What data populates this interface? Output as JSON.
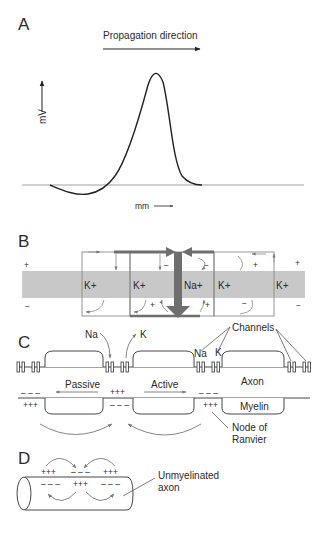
{
  "figure": {
    "panels": {
      "A": {
        "label": "A",
        "propagation_label": "Propagation direction",
        "y_axis_label": "mV",
        "x_axis_label": "mm",
        "curve": "action-potential"
      },
      "B": {
        "label": "B",
        "ion_labels": [
          "K+",
          "K+",
          "Na+",
          "K+",
          "K+"
        ],
        "outside_charges": [
          "+",
          "−",
          "−",
          "+",
          "+"
        ],
        "inside_charges": [
          "−",
          "+",
          "+",
          "−",
          "−"
        ]
      },
      "C": {
        "label": "C",
        "na_label": "Na",
        "k_label": "K",
        "channels_label": "Channels",
        "na_label_2": "Na",
        "k_label_2": "K",
        "axon_label": "Axon",
        "myelin_label": "Myelin",
        "passive_label": "Passive",
        "active_label": "Active",
        "node_label_line1": "Node of",
        "node_label_line2": "Ranvier",
        "charges": {
          "left_top": "– – –",
          "left_bottom": "+++",
          "mid_top": "+++",
          "mid_bottom": "– – –",
          "right_top": "– – –",
          "right_bottom": "+++"
        }
      },
      "D": {
        "label": "D",
        "unmyelinated_line1": "Unmyelinated",
        "unmyelinated_line2": "axon",
        "charges_top": [
          "+++",
          "– – –",
          "+++"
        ],
        "charges_bottom": [
          "– – –",
          "+++",
          "– – –"
        ]
      }
    },
    "colors": {
      "membrane_fill": "#c8c8c8",
      "arrow_dark": "#6e6e6e",
      "line": "#333333",
      "thin_arrow": "#7a7a7a"
    }
  }
}
